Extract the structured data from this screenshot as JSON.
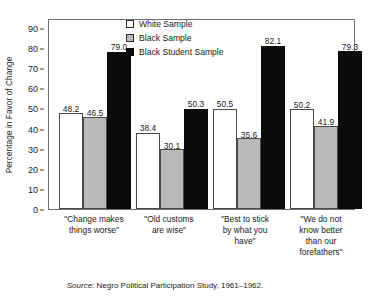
{
  "chart_data": {
    "type": "bar",
    "title": "",
    "xlabel": "",
    "ylabel": "Percentage in Favor of Change",
    "ylim": [
      0,
      95
    ],
    "yticks": [
      0,
      10,
      20,
      30,
      40,
      50,
      60,
      70,
      80,
      90
    ],
    "grid": false,
    "legend_position": "top-center",
    "categories": [
      "\"Change makes things worse\"",
      "\"Old customs are wise\"",
      "\"Best to stick by what you have\"",
      "\"We do not know better than our forefathers\""
    ],
    "series": [
      {
        "name": "White Sample",
        "color": "#ffffff",
        "values": [
          48.2,
          38.4,
          50.5,
          50.2
        ]
      },
      {
        "name": "Black Sample",
        "color": "#b9b9b9",
        "values": [
          46.5,
          30.1,
          35.6,
          41.9
        ]
      },
      {
        "name": "Black Student Sample",
        "color": "#0b0b0b",
        "values": [
          79.0,
          50.3,
          82.1,
          79.3
        ]
      }
    ],
    "data_labels": [
      [
        "48.2",
        "46.5",
        "79.0"
      ],
      [
        "38.4",
        "30.1",
        "50.3"
      ],
      [
        "50.5",
        "35.6",
        "82.1"
      ],
      [
        "50.2",
        "41.9",
        "79.3"
      ]
    ],
    "annotations": [
      "Source: Negro Political Participation Study, 1961-1962."
    ]
  },
  "axis": {
    "ylabel": "Percentage in Favor of Change",
    "ytick_labels": [
      "90",
      "80",
      "70",
      "60",
      "50",
      "40",
      "30",
      "20",
      "10",
      "0"
    ]
  },
  "legend": {
    "items": [
      {
        "label": "White Sample"
      },
      {
        "label": "Black Sample"
      },
      {
        "label": "Black Student Sample"
      }
    ]
  },
  "categories": [
    {
      "lines": [
        "\"Change makes",
        "things worse\""
      ]
    },
    {
      "lines": [
        "\"Old customs",
        "are wise\""
      ]
    },
    {
      "lines": [
        "\"Best to stick",
        "by what you",
        "have\""
      ]
    },
    {
      "lines": [
        "\"We do not",
        "know better",
        "than our",
        "forefathers\""
      ]
    }
  ],
  "source": {
    "prefix": "Source:",
    "text": "Negro Political Participation Study, 1961–1962."
  }
}
